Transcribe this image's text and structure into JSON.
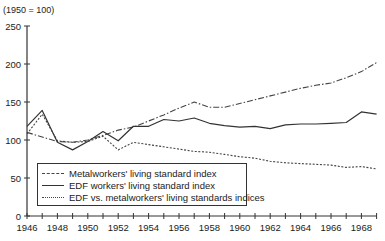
{
  "chart_data": {
    "type": "line",
    "title": "",
    "unit_label": "(1950 = 100)",
    "xlabel": "",
    "ylabel": "(1950 = 100)",
    "x": [
      1946,
      1947,
      1948,
      1949,
      1950,
      1951,
      1952,
      1953,
      1954,
      1955,
      1956,
      1957,
      1958,
      1959,
      1960,
      1961,
      1962,
      1963,
      1964,
      1965,
      1966,
      1967,
      1968,
      1969
    ],
    "x_tick_labels": [
      "1946",
      "1948",
      "1950",
      "1952",
      "1954",
      "1956",
      "1958",
      "1960",
      "1962",
      "1964",
      "1966",
      "1968"
    ],
    "y_ticks": [
      0,
      50,
      100,
      150,
      200,
      250
    ],
    "ylim": [
      0,
      250
    ],
    "xlim": [
      1946,
      1969
    ],
    "grid": false,
    "legend_position": "lower-left inside plot",
    "series": [
      {
        "name": "Metalworkers' living standard index",
        "style": "dash-dot",
        "values": [
          110,
          104,
          98,
          97,
          100,
          106,
          113,
          117,
          125,
          133,
          142,
          150,
          143,
          143,
          148,
          153,
          158,
          163,
          168,
          172,
          175,
          182,
          190,
          202
        ]
      },
      {
        "name": "EDF workers' living standard index",
        "style": "solid",
        "values": [
          118,
          139,
          97,
          87,
          98,
          111,
          99,
          118,
          118,
          127,
          125,
          129,
          122,
          119,
          117,
          118,
          115,
          120,
          121,
          121,
          122,
          123,
          137,
          134
        ]
      },
      {
        "name": "EDF vs. metalworkers' living standards indices",
        "style": "dotted",
        "values": [
          108,
          134,
          99,
          97,
          98,
          105,
          87,
          97,
          94,
          91,
          88,
          85,
          84,
          81,
          78,
          76,
          72,
          70,
          69,
          68,
          67,
          64,
          65,
          62
        ]
      }
    ]
  }
}
